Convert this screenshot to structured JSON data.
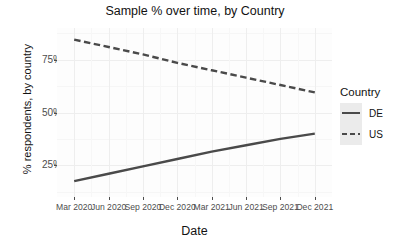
{
  "chart_data": {
    "type": "line",
    "title": "Sample % over time, by Country",
    "xlabel": "Date",
    "ylabel": "% respondents, by country",
    "x_tick_labels": [
      "Mar 2020",
      "Jun 2020",
      "Sep 2020",
      "Dec 2020",
      "Mar 2021",
      "Jun 2021",
      "Sep 2021",
      "Dec 2021"
    ],
    "y_tick_labels": [
      "25%",
      "50%",
      "75%"
    ],
    "y_tick_values": [
      25,
      50,
      75
    ],
    "ylim": [
      10,
      90
    ],
    "grid": true,
    "legend": {
      "title": "Country",
      "position": "right",
      "entries": [
        {
          "label": "DE",
          "style": "solid",
          "color": "#4a4a4a"
        },
        {
          "label": "US",
          "style": "dashed",
          "color": "#4a4a4a"
        }
      ]
    },
    "x": [
      "Mar 2020",
      "Jun 2020",
      "Sep 2020",
      "Dec 2020",
      "Mar 2021",
      "Jun 2021",
      "Sep 2021",
      "Dec 2021"
    ],
    "series": [
      {
        "name": "DE",
        "style": "solid",
        "color": "#4a4a4a",
        "values": [
          17.5,
          21.0,
          24.5,
          28.0,
          31.5,
          34.5,
          37.5,
          40.0
        ]
      },
      {
        "name": "US",
        "style": "dashed",
        "color": "#4a4a4a",
        "values": [
          84.5,
          81.0,
          77.5,
          73.5,
          70.0,
          66.5,
          63.0,
          59.5
        ]
      }
    ]
  }
}
